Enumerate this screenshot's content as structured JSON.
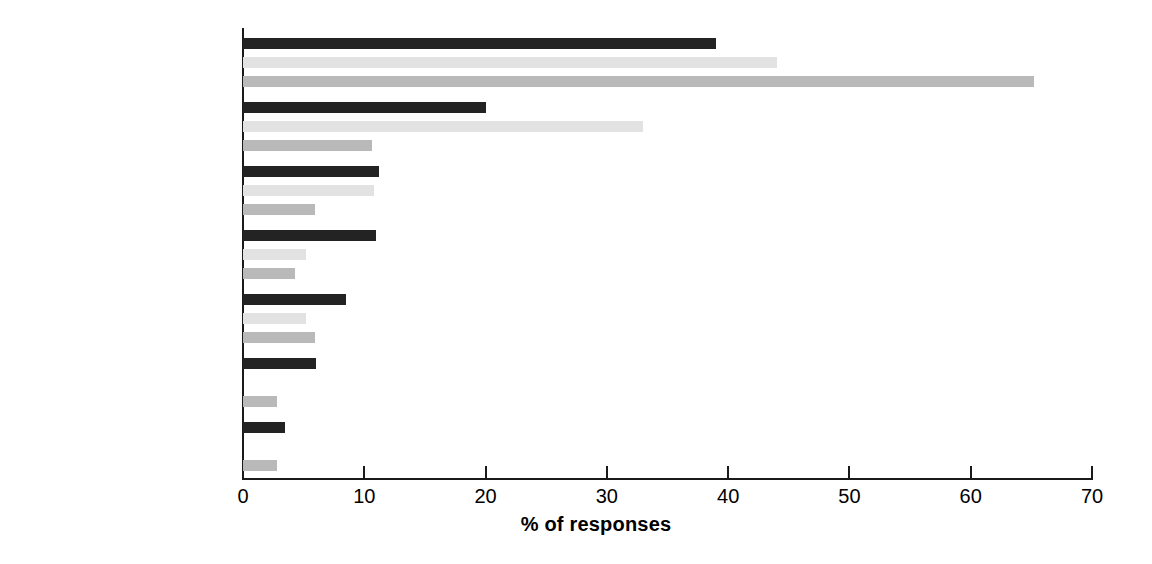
{
  "chart_data": {
    "type": "bar",
    "orientation": "horizontal",
    "title": "",
    "xlabel": "% of responses",
    "ylabel": "",
    "xlim": [
      0,
      70
    ],
    "xticks": [
      0,
      10,
      20,
      30,
      40,
      50,
      60,
      70
    ],
    "xtick_labels": [
      "0",
      "10",
      "20",
      "30",
      "40",
      "50",
      "60",
      "70"
    ],
    "grid": false,
    "legend": "none",
    "categories": [
      "Cost",
      "Standards",
      "Construction issues",
      "VAT",
      "Community issues",
      "Planning and density",
      "Not applicable"
    ],
    "series": [
      {
        "name": "Series 1",
        "color": "#232323",
        "values": [
          39.0,
          20.0,
          11.2,
          11.0,
          8.5,
          6.0,
          3.5
        ]
      },
      {
        "name": "Series 2",
        "color": "#e2e2e2",
        "values": [
          44.0,
          33.0,
          10.8,
          5.2,
          5.2,
          null,
          null
        ]
      },
      {
        "name": "Series 3",
        "color": "#b9b9b9",
        "values": [
          65.2,
          10.6,
          5.9,
          4.3,
          5.9,
          2.8,
          2.8
        ]
      }
    ]
  },
  "axis": {
    "x_title": "% of responses"
  }
}
